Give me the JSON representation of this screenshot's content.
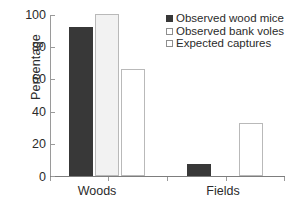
{
  "chart_data": {
    "type": "bar",
    "title": "",
    "xlabel": "",
    "ylabel": "Percentage",
    "categories": [
      "Woods",
      "Fields"
    ],
    "series": [
      {
        "name": "Observed wood mice",
        "values": [
          92,
          7.5
        ],
        "color": "#383838",
        "swatch": "filled"
      },
      {
        "name": "Observed bank voles",
        "values": [
          100,
          0
        ],
        "color": "#f2f2f2",
        "swatch": "open"
      },
      {
        "name": "Expected captures",
        "values": [
          66,
          33
        ],
        "color": "#ffffff",
        "swatch": "open"
      }
    ],
    "ylim": [
      0,
      100
    ],
    "yticks": [
      100,
      80,
      60,
      40,
      20,
      0
    ],
    "ytick_labels": [
      "100",
      "80",
      "60",
      "40",
      "20",
      "0"
    ],
    "grid": false,
    "legend_position": "top-right"
  },
  "axis": {
    "y_title": "Percentage",
    "tick_0": "0",
    "tick_20": "20",
    "tick_40": "40",
    "tick_60": "60",
    "tick_80": "80",
    "tick_100": "100",
    "cat_woods": "Woods",
    "cat_fields": "Fields"
  },
  "legend": {
    "item_0": "Observed wood mice",
    "item_1": "Observed bank voles",
    "item_2": "Expected captures"
  }
}
